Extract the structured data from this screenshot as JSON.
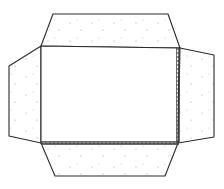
{
  "diagram": {
    "colors": {
      "background": "#ffffff",
      "stroke": "#2b2b2b",
      "dot": "#9a9a9a",
      "hatch": "#444444"
    },
    "shapes": {
      "center_panel": {
        "points": "41,46 179,48 178,143 41,143"
      },
      "top_flap": {
        "points": "41,46 53,14 168,14 180,48"
      },
      "left_flap": {
        "points": "41,46 9,66 9,136 41,143"
      },
      "right_flap": {
        "points": "180,48 214,55 214,137 178,143"
      },
      "bottom_flap": {
        "points": "41,143 178,143 165,176 55,176"
      }
    },
    "seams": [
      {
        "name": "right-glue-seam",
        "x1": 178,
        "y1": 48,
        "x2": 178,
        "y2": 143
      },
      {
        "name": "bottom-glue-seam",
        "x1": 41,
        "y1": 143,
        "x2": 178,
        "y2": 143
      }
    ]
  }
}
